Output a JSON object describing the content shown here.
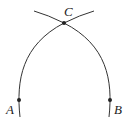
{
  "diagram": {
    "points": [
      {
        "label": "C",
        "x": 64,
        "y": 23
      },
      {
        "label": "A",
        "x": 19,
        "y": 100
      },
      {
        "label": "B",
        "x": 110,
        "y": 100
      }
    ],
    "stroke_color": "#333333"
  }
}
